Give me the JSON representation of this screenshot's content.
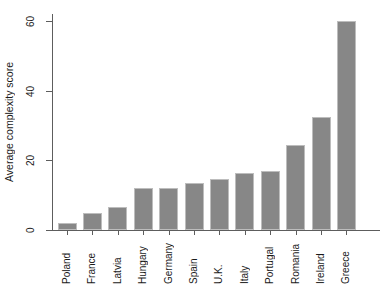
{
  "chart_data": {
    "type": "bar",
    "title": "",
    "xlabel": "",
    "ylabel": "Average complexity score",
    "categories": [
      "Poland",
      "France",
      "Latvia",
      "Hungary",
      "Germany",
      "Spain",
      "U.K.",
      "Italy",
      "Portugal",
      "Romania",
      "Ireland",
      "Greece"
    ],
    "values": [
      2,
      5,
      6.5,
      12,
      12,
      13.5,
      14.7,
      16.3,
      17,
      24.5,
      32.5,
      60
    ],
    "ylim": [
      0,
      62
    ],
    "yticks": [
      0,
      20,
      40,
      60
    ],
    "ytick_labels": [
      "0",
      "20",
      "40",
      "60"
    ],
    "grid": false,
    "legend": null,
    "bar_color": "#878787",
    "bar_edge_color": "#bdbdbd",
    "axis_color": "#5d5d5d",
    "background": "#ffffff"
  },
  "axes": {
    "y_title": "Average complexity score"
  }
}
